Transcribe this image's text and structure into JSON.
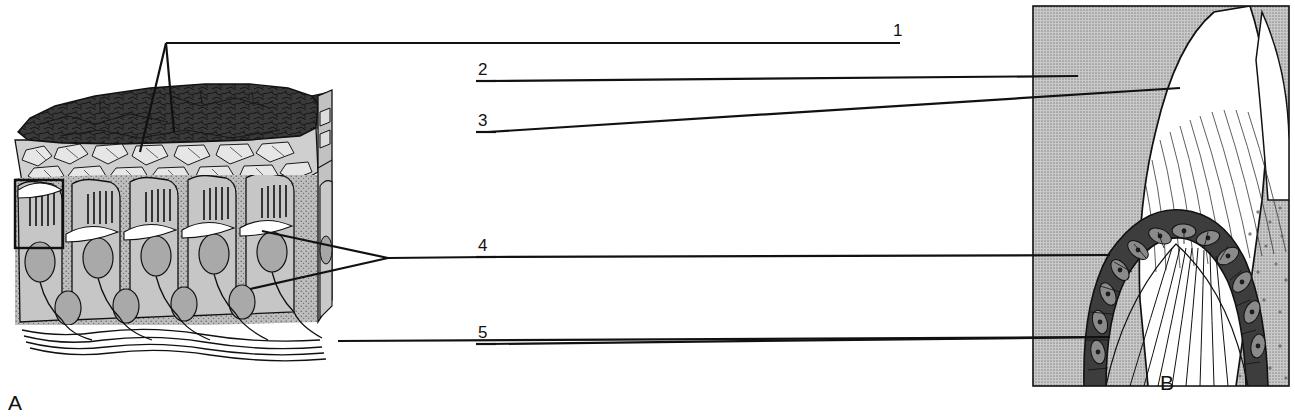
{
  "figure": {
    "type": "labeled-anatomical-diagram",
    "background": "#ffffff",
    "ink": "#111111",
    "panels": [
      {
        "id": "A",
        "letter": "A",
        "caption_letter_position": {
          "x": 8,
          "y": 392
        },
        "description": "Three-dimensional block diagram of ameloblasts with Tomes' processes, enamel matrix and nerve/vessel fibres",
        "bounds": {
          "x": 8,
          "y": 30,
          "width": 340,
          "height": 360
        },
        "fill_tones": {
          "dark_enamel": "#3a3a3a",
          "mid_gray": "#b9b9b9",
          "light_gray": "#d8d8d8",
          "white": "#ffffff"
        },
        "inset_box": {
          "x": 15,
          "y": 180,
          "width": 48,
          "height": 68,
          "label": "detail-region"
        }
      },
      {
        "id": "B",
        "letter": "B",
        "caption_letter_position": {
          "x": 1160,
          "y": 372
        },
        "description": "Longitudinal section through a tooth cusp showing enamel, dentine and the ameloblast cell layer",
        "bounds": {
          "x": 1032,
          "y": 5,
          "width": 258,
          "height": 382
        },
        "fill_tones": {
          "gray_background": "#b5b5b5",
          "white": "#ffffff",
          "dark_cells": "#3d3d3d",
          "mid_gray": "#8f8f8f"
        }
      }
    ],
    "leader_labels": [
      {
        "number": "1",
        "text_x": 893,
        "text_y": 24,
        "line_path": "M 900 43 L 165 43 L 165 43",
        "branch": true,
        "target_panel": "A",
        "targets": [
          [
            138,
            152
          ],
          [
            171,
            130
          ]
        ]
      },
      {
        "number": "2",
        "text_x": 479,
        "text_y": 63,
        "line_path": "M 496 81 L 1078 76",
        "target_panel": "B",
        "target": [
          1078,
          76
        ]
      },
      {
        "number": "3",
        "text_x": 479,
        "text_y": 114,
        "line_path": "M 496 132 L 1178 88",
        "target_panel": "B",
        "target": [
          1178,
          88
        ]
      },
      {
        "number": "4",
        "text_x": 479,
        "text_y": 239,
        "line_path": "M 496 257 L 1110 255",
        "target_panel": "B",
        "target": [
          1110,
          255
        ],
        "branch": true,
        "branch_targets": [
          [
            265,
            231
          ],
          [
            252,
            288
          ]
        ]
      },
      {
        "number": "5",
        "text_x": 479,
        "text_y": 326,
        "line_path": "M 496 344 L 1110 337",
        "target_panel": "B",
        "target": [
          1110,
          337
        ],
        "origin_panel": "A",
        "origin": [
          340,
          341
        ]
      }
    ],
    "label_count": 5,
    "panel_count": 2
  }
}
